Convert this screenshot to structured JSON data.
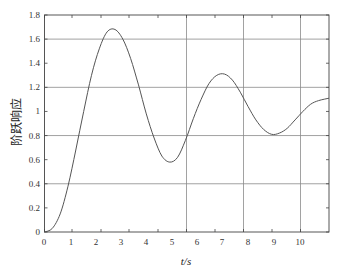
{
  "chart_data": {
    "type": "line",
    "title": "",
    "xlabel": "t/s",
    "ylabel": "阶跃响应",
    "xlim": [
      0,
      10.9
    ],
    "ylim": [
      0,
      1.8
    ],
    "grid": {
      "horizontal": [
        0.4,
        0.8,
        1.2,
        1.6
      ],
      "vertical_at_x_px": [
        186.5,
        243.5,
        300.5
      ]
    },
    "x_ticks": [
      "0",
      "1",
      "2",
      "3",
      "4",
      "5",
      "6",
      "7",
      "8",
      "9",
      "10"
    ],
    "y_ticks": [
      "0",
      "0.2",
      "0.4",
      "0.6",
      "0.8",
      "1",
      "1.2",
      "1.4",
      "1.6",
      "1.8"
    ],
    "series": [
      {
        "name": "step response",
        "x": [
          0,
          0.3,
          0.6,
          0.9,
          1.2,
          1.5,
          1.8,
          2.1,
          2.4,
          2.7,
          3.0,
          3.3,
          3.6,
          3.9,
          4.2,
          4.5,
          4.8,
          5.1,
          5.4,
          5.7,
          6.0,
          6.3,
          6.6,
          6.9,
          7.2,
          7.5,
          7.8,
          8.1,
          8.4,
          8.7,
          9.0,
          9.3,
          9.6,
          9.9,
          10.2,
          10.5,
          10.9
        ],
        "values": [
          0,
          0.03,
          0.15,
          0.38,
          0.68,
          1.0,
          1.3,
          1.52,
          1.66,
          1.68,
          1.6,
          1.44,
          1.22,
          0.98,
          0.78,
          0.63,
          0.58,
          0.62,
          0.76,
          0.94,
          1.1,
          1.23,
          1.3,
          1.31,
          1.26,
          1.16,
          1.04,
          0.93,
          0.85,
          0.81,
          0.82,
          0.86,
          0.93,
          1.0,
          1.06,
          1.09,
          1.11
        ]
      }
    ],
    "annotations": []
  },
  "colors": {
    "line": "#555555",
    "grid": "#8a8a8a",
    "axis": "#444444",
    "text": "#333333"
  }
}
